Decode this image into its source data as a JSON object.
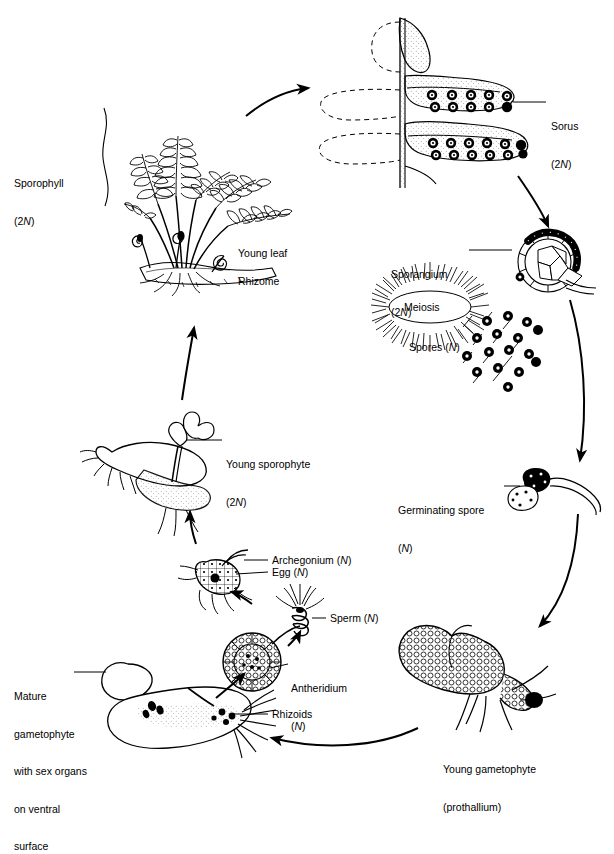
{
  "figure": {
    "type": "biological-life-cycle-diagram",
    "style": "black-and-white line drawing",
    "background_color": "#ffffff",
    "ink_color": "#000000"
  },
  "labels": {
    "sporophyll": {
      "line1": "Sporophyll",
      "line2": "(2N)"
    },
    "young_leaf": {
      "line1": "Young leaf"
    },
    "rhizome": {
      "line1": "Rhizome"
    },
    "sorus": {
      "line1": "Sorus",
      "line2": "(2N)"
    },
    "sporangium": {
      "line1": "Sporangium",
      "line2": "(2N)"
    },
    "meiosis": {
      "line1": "Meiosis"
    },
    "spores": {
      "line1": "Spores (N)"
    },
    "germinating_spore": {
      "line1": "Germinating spore",
      "line2": "(N)"
    },
    "young_gametophyte": {
      "line1": "Young gametophyte",
      "line2": "(prothallium)"
    },
    "rhizoids": {
      "line1": "Rhizoids"
    },
    "mature_gametophyte": {
      "line1": "Mature",
      "line2": "gametophyte",
      "line3": "with sex organs",
      "line4": "on ventral",
      "line5": "surface"
    },
    "antheridium": {
      "line1": "Antheridium",
      "line2": "(N)"
    },
    "sperm": {
      "line1": "Sperm (N)"
    },
    "archegonium": {
      "line1": "Archegonium (N)"
    },
    "egg": {
      "line1": "Egg (N)"
    },
    "young_sporophyte": {
      "line1": "Young sporophyte",
      "line2": "(2N)"
    }
  },
  "structures": [
    {
      "name": "sporophyll-fern-plant",
      "ploidy": "2N",
      "description": "Adult fern plant with fronds, fiddleheads and rhizome"
    },
    {
      "name": "sorus-pinna-detail",
      "ploidy": "2N",
      "description": "Magnified frond pinna showing four rows of sori",
      "sori_rows": 4,
      "sporangia_per_row": [
        5,
        6,
        6,
        6
      ]
    },
    {
      "name": "sporangium",
      "ploidy": "2N",
      "description": "Sporangium with annulus releasing spores"
    },
    {
      "name": "meiosis-burst",
      "description": "Starburst shape labelled Meiosis"
    },
    {
      "name": "spores",
      "ploidy": "N",
      "description": "Scattered dark round spores",
      "count": 16
    },
    {
      "name": "germinating-spore",
      "ploidy": "N",
      "description": "Spore germinating with emerging filament"
    },
    {
      "name": "young-gametophyte-prothallium",
      "ploidy": "N",
      "description": "Heart-shaped cellular prothallium with rhizoids"
    },
    {
      "name": "mature-gametophyte",
      "ploidy": "N",
      "description": "Mature prothallium with sex organs on ventral surface"
    },
    {
      "name": "antheridium",
      "ploidy": "N",
      "description": "Cellular antheridium producing sperm"
    },
    {
      "name": "sperm",
      "ploidy": "N",
      "description": "Coiled flagellated sperm cell"
    },
    {
      "name": "archegonium",
      "ploidy": "N",
      "description": "Flask-shaped archegonium containing the egg"
    },
    {
      "name": "young-sporophyte",
      "ploidy": "2N",
      "description": "Young sporophyte leaf growing from gametophyte"
    }
  ],
  "cycle_arrows": [
    {
      "from": "sporophyll-fern-plant",
      "to": "sorus-pinna-detail"
    },
    {
      "from": "sorus-pinna-detail",
      "to": "sporangium"
    },
    {
      "from": "sporangium",
      "to": "germinating-spore"
    },
    {
      "from": "germinating-spore",
      "to": "young-gametophyte-prothallium"
    },
    {
      "from": "young-gametophyte-prothallium",
      "to": "mature-gametophyte"
    },
    {
      "from": "mature-gametophyte",
      "to": "antheridium"
    },
    {
      "from": "antheridium",
      "to": "sperm"
    },
    {
      "from": "sperm",
      "to": "archegonium"
    },
    {
      "from": "archegonium",
      "to": "young-sporophyte"
    },
    {
      "from": "young-sporophyte",
      "to": "sporophyll-fern-plant"
    }
  ]
}
